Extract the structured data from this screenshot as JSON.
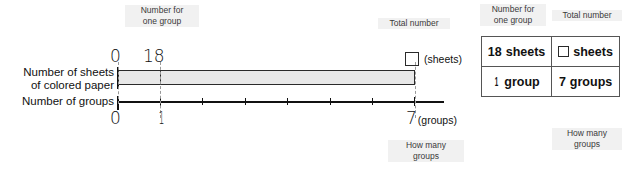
{
  "diagram": {
    "annotations": {
      "number_for_one_group": {
        "line1": "Number for",
        "line2": "one group"
      },
      "total_number": {
        "line1": "Total number",
        "line2": ""
      },
      "how_many_groups": {
        "line1": "How many",
        "line2": "groups"
      }
    },
    "row_labels": {
      "sheets": {
        "line1": "Number of sheets",
        "line2": "of colored paper"
      },
      "groups": {
        "line1": "Number of groups",
        "line2": ""
      }
    },
    "top_scale": {
      "zero": "0",
      "one_group_value": "18",
      "total_unit": "(sheets)",
      "answer_box_value": ""
    },
    "bottom_scale": {
      "zero": "0",
      "one": "1",
      "end": "7",
      "unit": "(groups)"
    },
    "bar": {
      "fill_color": "#e8e8e8",
      "stroke_color": "#2a2a2a"
    },
    "axis": {
      "tick_count": 7,
      "min": 0,
      "max": 7
    }
  },
  "table": {
    "headers": {
      "col1": {
        "line1": "Number for",
        "line2": "one group"
      },
      "col2": {
        "line1": "Total number",
        "line2": ""
      }
    },
    "rows": [
      {
        "col1_number": "18",
        "col1_unit": "sheets",
        "col2_number": "",
        "col2_unit": "sheets"
      },
      {
        "col1_number": "1",
        "col1_unit": "group",
        "col2_number": "7",
        "col2_unit": "groups"
      }
    ],
    "footnote": {
      "line1": "How many",
      "line2": "groups"
    }
  }
}
